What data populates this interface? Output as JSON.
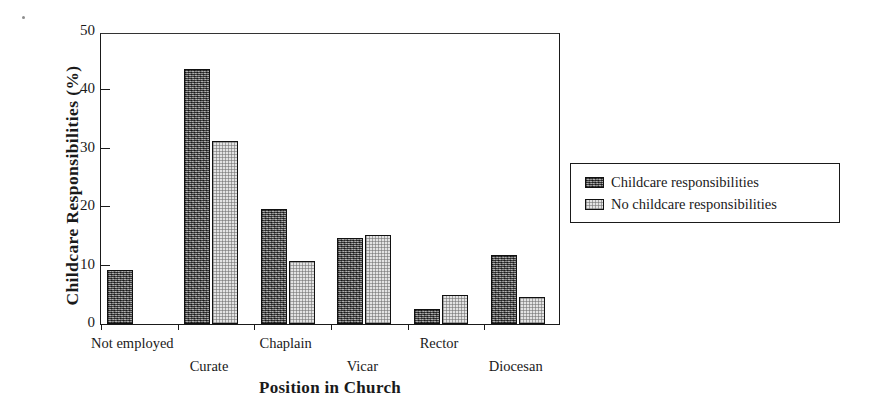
{
  "chart_data": {
    "type": "bar",
    "title": "",
    "xlabel": "Position in Church",
    "ylabel": "Childcare Responsibilities (%)",
    "categories": [
      "Not employed",
      "Curate",
      "Chaplain",
      "Vicar",
      "Rector",
      "Diocesan"
    ],
    "series": [
      {
        "name": "Childcare responsibilities",
        "color": "#6f6f6f",
        "pattern": "dark-hatch",
        "values": [
          9.2,
          43.6,
          19.7,
          14.7,
          2.6,
          11.8
        ]
      },
      {
        "name": "No childcare responsibilities",
        "color": "#e3e3e3",
        "pattern": "light-dot",
        "values": [
          0,
          31.3,
          10.8,
          15.2,
          4.9,
          4.7
        ]
      }
    ],
    "ylim": [
      0,
      50
    ],
    "yticks": [
      0,
      10,
      20,
      30,
      40,
      50
    ],
    "ytick_labels": [
      "0",
      "10",
      "20",
      "30",
      "40",
      "50"
    ],
    "grid": false,
    "legend_position": "right"
  },
  "legend": {
    "entries": [
      {
        "label": "Childcare responsibilities"
      },
      {
        "label": "No childcare responsibilities"
      }
    ]
  }
}
